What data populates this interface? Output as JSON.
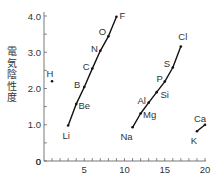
{
  "chart_data": {
    "type": "line",
    "title": "",
    "xlabel": "",
    "ylabel": "電気陰性度",
    "xlim": [
      0,
      20
    ],
    "ylim": [
      0,
      4.0
    ],
    "x_ticks": [
      0,
      5,
      10,
      15,
      20
    ],
    "x_tick_labels": [
      "0",
      "5",
      "10",
      "15",
      "20"
    ],
    "x_minor_step": 1,
    "y_ticks": [
      0,
      1.0,
      2.0,
      3.0,
      4.0
    ],
    "y_tick_labels": [
      "0",
      "1.0",
      "2.0",
      "3.0",
      "4.0"
    ],
    "y_minor_step": 0.5,
    "grid": false,
    "legend": null,
    "series": [
      {
        "name": "Period 1",
        "points": [
          {
            "label": "H",
            "x": 1,
            "y": 2.2
          }
        ]
      },
      {
        "name": "Period 2",
        "points": [
          {
            "label": "Li",
            "x": 3,
            "y": 0.98
          },
          {
            "label": "Be",
            "x": 4,
            "y": 1.57
          },
          {
            "label": "B",
            "x": 5,
            "y": 2.04
          },
          {
            "label": "C",
            "x": 6,
            "y": 2.55
          },
          {
            "label": "N",
            "x": 7,
            "y": 3.04
          },
          {
            "label": "O",
            "x": 8,
            "y": 3.44
          },
          {
            "label": "F",
            "x": 9,
            "y": 3.98
          }
        ]
      },
      {
        "name": "Period 3",
        "points": [
          {
            "label": "Na",
            "x": 11,
            "y": 0.93
          },
          {
            "label": "Mg",
            "x": 12,
            "y": 1.31
          },
          {
            "label": "Al",
            "x": 13,
            "y": 1.61
          },
          {
            "label": "Si",
            "x": 14,
            "y": 1.9
          },
          {
            "label": "P",
            "x": 15,
            "y": 2.19
          },
          {
            "label": "S",
            "x": 16,
            "y": 2.58
          },
          {
            "label": "Cl",
            "x": 17,
            "y": 3.16
          }
        ]
      },
      {
        "name": "Period 4",
        "points": [
          {
            "label": "K",
            "x": 19,
            "y": 0.82
          },
          {
            "label": "Ca",
            "x": 20,
            "y": 1.0
          }
        ]
      }
    ],
    "label_offsets": {
      "H": [
        -2,
        -7
      ],
      "Li": [
        -2,
        11
      ],
      "Be": [
        8,
        2
      ],
      "B": [
        -7,
        -2
      ],
      "C": [
        -6,
        -2
      ],
      "N": [
        -6,
        -2
      ],
      "O": [
        -6,
        -4
      ],
      "F": [
        6,
        -1
      ],
      "Na": [
        -6,
        10
      ],
      "Mg": [
        9,
        1
      ],
      "Al": [
        -7,
        -2
      ],
      "Si": [
        8,
        3
      ],
      "P": [
        -5,
        -3
      ],
      "S": [
        -6,
        -3
      ],
      "Cl": [
        2,
        -9
      ],
      "K": [
        -3,
        10
      ],
      "Ca": [
        -5,
        -6
      ]
    }
  },
  "colors": {
    "axis": "#555555",
    "line": "#111111",
    "text": "#333333"
  }
}
